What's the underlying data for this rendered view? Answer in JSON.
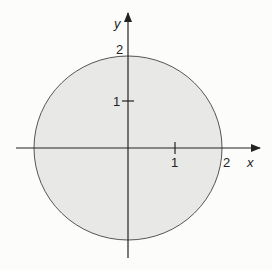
{
  "diagram": {
    "type": "filled-disk-on-axes",
    "axes": {
      "x_label": "x",
      "y_label": "y"
    },
    "ticks": {
      "x": [
        {
          "value": 1,
          "label": "1"
        },
        {
          "value": 2,
          "label": "2"
        }
      ],
      "y": [
        {
          "value": 1,
          "label": "1"
        },
        {
          "value": 2,
          "label": "2"
        }
      ]
    },
    "region": {
      "shape": "circle",
      "center": [
        0,
        0
      ],
      "radius": 2,
      "fill_color": "#e8e8e6",
      "stroke_color": "#555555"
    },
    "colors": {
      "background": "#fcfcfb",
      "axis": "#222222"
    }
  }
}
